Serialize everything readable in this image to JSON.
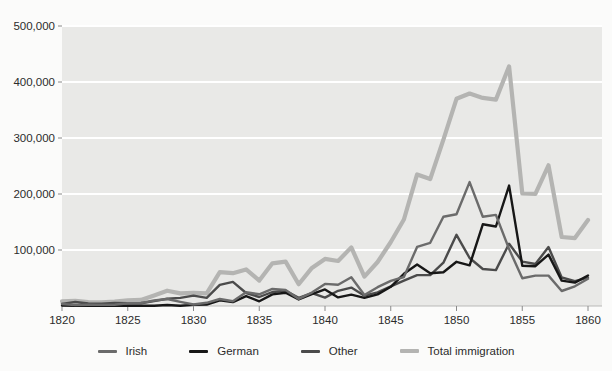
{
  "figure": {
    "background": "#fbfbfa",
    "panel_background": "#e9e9e7",
    "grid_color": "#ffffff",
    "tick_color": "#8a8a8a",
    "text_color": "#2b2b2b"
  },
  "chart_data": {
    "type": "line",
    "title": "",
    "xlabel": "",
    "ylabel": "",
    "xlim": [
      1820,
      1860
    ],
    "ylim": [
      0,
      500000
    ],
    "grid": true,
    "legend_position": "bottom-center",
    "x": [
      1820,
      1821,
      1822,
      1823,
      1824,
      1825,
      1826,
      1827,
      1828,
      1829,
      1830,
      1831,
      1832,
      1833,
      1834,
      1835,
      1836,
      1837,
      1838,
      1839,
      1840,
      1841,
      1842,
      1843,
      1844,
      1845,
      1846,
      1847,
      1848,
      1849,
      1850,
      1851,
      1852,
      1853,
      1854,
      1855,
      1856,
      1857,
      1858,
      1859,
      1860
    ],
    "x_tick_years": [
      1820,
      1825,
      1830,
      1835,
      1840,
      1845,
      1850,
      1855,
      1860
    ],
    "x_tick_labels": [
      "1820",
      "1825",
      "1830",
      "1835",
      "1840",
      "1845",
      "1850",
      "1855",
      "1860"
    ],
    "y_tick_values": [
      100000,
      200000,
      300000,
      400000,
      500000
    ],
    "y_tick_labels": [
      "100,000",
      "200,000",
      "300,000",
      "400,000",
      "500,000"
    ],
    "series": [
      {
        "name": "Irish",
        "color": "#6b6b6b",
        "stroke_width": 2.4,
        "values": [
          3614,
          1518,
          2267,
          1908,
          2345,
          4888,
          5408,
          9766,
          12488,
          7415,
          2721,
          5772,
          12436,
          8648,
          24474,
          20927,
          30578,
          28508,
          12645,
          23963,
          39430,
          37772,
          51342,
          19670,
          33490,
          44821,
          51752,
          105536,
          112934,
          159398,
          164004,
          221253,
          159548,
          162649,
          101606,
          49627,
          54349,
          54361,
          26873,
          35216,
          48637
        ]
      },
      {
        "name": "German",
        "color": "#171717",
        "stroke_width": 2.4,
        "values": [
          968,
          383,
          148,
          183,
          230,
          450,
          511,
          432,
          1851,
          597,
          1976,
          2413,
          10194,
          6988,
          17686,
          8311,
          20707,
          23740,
          11683,
          21028,
          29704,
          15291,
          20370,
          14441,
          20731,
          34355,
          57561,
          74281,
          58465,
          60235,
          78896,
          72482,
          145918,
          141946,
          215009,
          71918,
          71028,
          91781,
          45310,
          41784,
          54491
        ]
      },
      {
        "name": "Other",
        "color": "#4b4b4b",
        "stroke_width": 2.4,
        "values": [
          3803,
          7226,
          4496,
          4263,
          5337,
          4861,
          4918,
          8677,
          13043,
          14508,
          18625,
          14448,
          37852,
          43004,
          23205,
          16136,
          24957,
          27092,
          14586,
          23078,
          14932,
          27226,
          32853,
          18385,
          24394,
          35195,
          45103,
          55151,
          55128,
          77391,
          127080,
          85731,
          66137,
          64050,
          111218,
          79332,
          75059,
          105164,
          50943,
          44282,
          50512
        ]
      },
      {
        "name": "Total immigration",
        "color": "#b4b4b2",
        "stroke_width": 4.2,
        "values": [
          8385,
          9127,
          6911,
          6354,
          7912,
          10199,
          10837,
          18875,
          27382,
          22520,
          23322,
          22633,
          60482,
          58640,
          65365,
          45374,
          76242,
          79340,
          38914,
          68069,
          84066,
          80289,
          104565,
          52496,
          78615,
          114371,
          154416,
          234968,
          226527,
          297024,
          369980,
          379466,
          371603,
          368645,
          427833,
          200877,
          200436,
          251306,
          123126,
          121282,
          153640
        ]
      }
    ]
  }
}
